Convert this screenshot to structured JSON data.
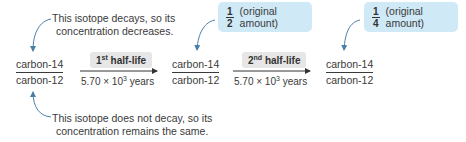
{
  "callouts": {
    "top": {
      "line1": "This isotope decays, so its",
      "line2": "concentration decreases."
    },
    "bottom": {
      "line1": "This isotope does not decay, so its",
      "line2": "concentration remains the same."
    }
  },
  "ratios": [
    {
      "numerator": "carbon-14",
      "denominator": "carbon-12"
    },
    {
      "numerator": "carbon-14",
      "denominator": "carbon-12"
    },
    {
      "numerator": "carbon-14",
      "denominator": "carbon-12"
    }
  ],
  "steps": [
    {
      "ordinal": "1",
      "suffix": "st",
      "label": "half-life",
      "years_base": "5.70 × 10",
      "years_exp": "3",
      "years_unit": "years"
    },
    {
      "ordinal": "2",
      "suffix": "nd",
      "label": "half-life",
      "years_base": "5.70 × 10",
      "years_exp": "3",
      "years_unit": "years"
    }
  ],
  "amounts": [
    {
      "numerator": "1",
      "denominator": "2",
      "text": "(original amount)"
    },
    {
      "numerator": "1",
      "denominator": "4",
      "text": "(original amount)"
    }
  ],
  "colors": {
    "arrow_blue": "#4a7fa8",
    "amount_box": "#cfe9f6",
    "label_box": "#e6e6e6"
  }
}
